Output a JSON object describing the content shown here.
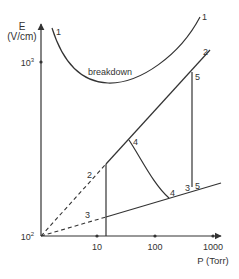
{
  "axes": {
    "y_label_line1": "E",
    "y_label_line2": "(V/cm)",
    "x_label": "P (Torr)",
    "y_ticks": [
      {
        "label_base": "10",
        "label_exp": "3"
      },
      {
        "label_base": "10",
        "label_exp": "2"
      }
    ],
    "x_ticks": [
      "10",
      "100",
      "1000"
    ]
  },
  "curves": {
    "breakdown_label": "breakdown",
    "curve1_label_left": "1",
    "curve1_label_right": "1",
    "line2_label_top": "2",
    "line2_label_dashed": "2",
    "line3_label_dashed": "3",
    "point4_upper": "4",
    "point4_lower": "4",
    "point3_lower": "3",
    "point5_lower": "5",
    "point5_upper": "5"
  },
  "colors": {
    "line": "#333333",
    "background": "#ffffff"
  }
}
